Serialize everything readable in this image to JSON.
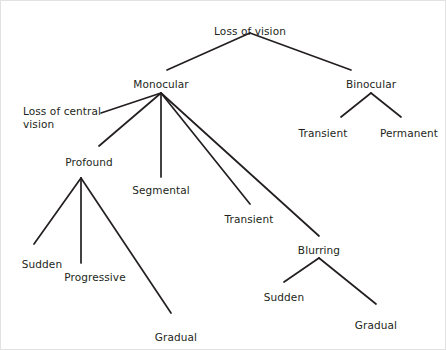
{
  "diagram": {
    "type": "tree",
    "line_color": "#231f20",
    "text_color": "#231f20",
    "background": "#ffffff",
    "border_color": "#e2e2e2",
    "nodes": [
      {
        "id": "loss-of-vision",
        "label": "Loss of vision",
        "x": 249,
        "y": 24,
        "align": "center",
        "anchor_x": 249,
        "anchor_y": 32
      },
      {
        "id": "monocular",
        "label": "Monocular",
        "x": 160,
        "y": 77,
        "align": "center",
        "anchor_x": 160,
        "anchor_y": 92
      },
      {
        "id": "binocular",
        "label": "Binocular",
        "x": 370,
        "y": 77,
        "align": "center",
        "anchor_x": 370,
        "anchor_y": 92
      },
      {
        "id": "transient-binocular",
        "label": "Transient",
        "x": 322,
        "y": 126,
        "align": "center",
        "anchor_x": 322,
        "anchor_y": 122
      },
      {
        "id": "permanent",
        "label": "Permanent",
        "x": 408,
        "y": 126,
        "align": "center",
        "anchor_x": 408,
        "anchor_y": 122
      },
      {
        "id": "loss-of-central-vision",
        "label": "Loss of central\nvision",
        "x": 22,
        "y": 104,
        "align": "left",
        "anchor_x": 100,
        "anchor_y": 112
      },
      {
        "id": "profound",
        "label": "Profound",
        "x": 88,
        "y": 155,
        "align": "center",
        "anchor_x": 88,
        "anchor_y": 148
      },
      {
        "id": "segmental",
        "label": "Segmental",
        "x": 160,
        "y": 183,
        "align": "center",
        "anchor_x": 160,
        "anchor_y": 176
      },
      {
        "id": "transient-monocular",
        "label": "Transient",
        "x": 248,
        "y": 212,
        "align": "center",
        "anchor_x": 248,
        "anchor_y": 205
      },
      {
        "id": "blurring",
        "label": "Blurring",
        "x": 318,
        "y": 243,
        "align": "center",
        "anchor_x": 318,
        "anchor_y": 257
      },
      {
        "id": "sudden-profound",
        "label": "Sudden",
        "x": 41,
        "y": 257,
        "align": "center",
        "anchor_x": 41,
        "anchor_y": 250
      },
      {
        "id": "progressive",
        "label": "Progressive",
        "x": 94,
        "y": 270,
        "align": "center",
        "anchor_x": 94,
        "anchor_y": 263
      },
      {
        "id": "gradual-profound",
        "label": "Gradual",
        "x": 175,
        "y": 330,
        "align": "center",
        "anchor_x": 175,
        "anchor_y": 322
      },
      {
        "id": "sudden-blurring",
        "label": "Sudden",
        "x": 283,
        "y": 290,
        "align": "center",
        "anchor_x": 283,
        "anchor_y": 283
      },
      {
        "id": "gradual-blurring",
        "label": "Gradual",
        "x": 375,
        "y": 318,
        "align": "center",
        "anchor_x": 375,
        "anchor_y": 311
      }
    ],
    "edges": [
      {
        "from": "loss-of-vision",
        "to": "monocular",
        "x1": 249,
        "y1": 32,
        "x2": 166,
        "y2": 69
      },
      {
        "from": "loss-of-vision",
        "to": "binocular",
        "x1": 249,
        "y1": 32,
        "x2": 350,
        "y2": 69
      },
      {
        "from": "binocular",
        "to": "transient-binocular",
        "x1": 370,
        "y1": 92,
        "x2": 340,
        "y2": 116
      },
      {
        "from": "binocular",
        "to": "permanent",
        "x1": 370,
        "y1": 92,
        "x2": 400,
        "y2": 116
      },
      {
        "from": "monocular",
        "to": "loss-of-central-vision",
        "x1": 160,
        "y1": 92,
        "x2": 100,
        "y2": 112
      },
      {
        "from": "monocular",
        "to": "profound",
        "x1": 160,
        "y1": 92,
        "x2": 98,
        "y2": 145
      },
      {
        "from": "monocular",
        "to": "segmental",
        "x1": 160,
        "y1": 92,
        "x2": 160,
        "y2": 176
      },
      {
        "from": "monocular",
        "to": "transient-monocular",
        "x1": 160,
        "y1": 92,
        "x2": 249,
        "y2": 203
      },
      {
        "from": "monocular",
        "to": "blurring",
        "x1": 160,
        "y1": 92,
        "x2": 318,
        "y2": 235
      },
      {
        "from": "profound",
        "to": "sudden-profound",
        "x1": 80,
        "y1": 177,
        "x2": 33,
        "y2": 243
      },
      {
        "from": "profound",
        "to": "progressive",
        "x1": 80,
        "y1": 177,
        "x2": 80,
        "y2": 262
      },
      {
        "from": "profound",
        "to": "gradual-profound",
        "x1": 80,
        "y1": 177,
        "x2": 170,
        "y2": 312
      },
      {
        "from": "blurring",
        "to": "sudden-blurring",
        "x1": 318,
        "y1": 257,
        "x2": 283,
        "y2": 281
      },
      {
        "from": "blurring",
        "to": "gradual-blurring",
        "x1": 318,
        "y1": 257,
        "x2": 375,
        "y2": 303
      }
    ]
  }
}
